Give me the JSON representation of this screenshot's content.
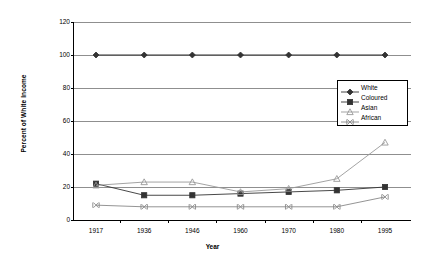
{
  "chart_data": {
    "type": "line",
    "title": "",
    "xlabel": "Year",
    "ylabel": "Percent of White Income",
    "categories": [
      "1917",
      "1936",
      "1946",
      "1960",
      "1970",
      "1980",
      "1995"
    ],
    "ylim": [
      0,
      120
    ],
    "yticks": [
      0,
      20,
      40,
      60,
      80,
      100,
      120
    ],
    "grid": true,
    "legend_position": "right-inside",
    "series": [
      {
        "name": "White",
        "marker": "filled-diamond",
        "color": "#333333",
        "values": [
          100,
          100,
          100,
          100,
          100,
          100,
          100
        ]
      },
      {
        "name": "Coloured",
        "marker": "filled-square",
        "color": "#333333",
        "values": [
          22,
          15,
          15,
          16,
          17,
          18,
          20
        ]
      },
      {
        "name": "Asian",
        "marker": "open-triangle",
        "color": "#999999",
        "values": [
          21,
          23,
          23,
          17,
          19,
          25,
          47
        ]
      },
      {
        "name": "African",
        "marker": "x-cross",
        "color": "#888888",
        "values": [
          9,
          8,
          8,
          8,
          8,
          8,
          14
        ]
      }
    ]
  }
}
